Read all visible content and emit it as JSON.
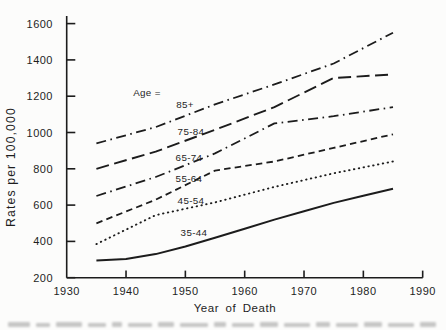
{
  "chart_data": {
    "type": "line",
    "title": "",
    "xlabel": "Year of Death",
    "ylabel": "Rates per 100,000",
    "legend_label": "Age =",
    "xlim": [
      1930,
      1990
    ],
    "ylim": [
      200,
      1600
    ],
    "x_ticks": [
      1930,
      1940,
      1950,
      1960,
      1970,
      1980,
      1990
    ],
    "y_ticks": [
      200,
      400,
      600,
      800,
      1000,
      1200,
      1400,
      1600
    ],
    "grid": false,
    "legend_position": "labels-on-lines",
    "ink_color": "#1c1c1c",
    "background_color": "#fcfcfb",
    "series": [
      {
        "name": "85+",
        "style": "dashdot",
        "points": [
          [
            1935,
            940
          ],
          [
            1945,
            1030
          ],
          [
            1955,
            1155
          ],
          [
            1965,
            1265
          ],
          [
            1975,
            1380
          ],
          [
            1985,
            1550
          ]
        ]
      },
      {
        "name": "75-84",
        "style": "longdash",
        "points": [
          [
            1935,
            800
          ],
          [
            1945,
            895
          ],
          [
            1955,
            1015
          ],
          [
            1965,
            1140
          ],
          [
            1975,
            1300
          ],
          [
            1985,
            1320
          ]
        ]
      },
      {
        "name": "65-74",
        "style": "dashdot",
        "points": [
          [
            1935,
            650
          ],
          [
            1945,
            755
          ],
          [
            1955,
            885
          ],
          [
            1965,
            1050
          ],
          [
            1975,
            1090
          ],
          [
            1985,
            1140
          ]
        ]
      },
      {
        "name": "55-64",
        "style": "mediumdash",
        "points": [
          [
            1935,
            500
          ],
          [
            1945,
            630
          ],
          [
            1955,
            790
          ],
          [
            1965,
            840
          ],
          [
            1975,
            915
          ],
          [
            1985,
            990
          ]
        ]
      },
      {
        "name": "45-54",
        "style": "dotted",
        "points": [
          [
            1935,
            385
          ],
          [
            1945,
            545
          ],
          [
            1955,
            615
          ],
          [
            1965,
            700
          ],
          [
            1975,
            775
          ],
          [
            1985,
            840
          ]
        ]
      },
      {
        "name": "35-44",
        "style": "solid",
        "points": [
          [
            1935,
            295
          ],
          [
            1940,
            303
          ],
          [
            1945,
            330
          ],
          [
            1950,
            372
          ],
          [
            1955,
            420
          ],
          [
            1960,
            470
          ],
          [
            1965,
            520
          ],
          [
            1970,
            566
          ],
          [
            1975,
            612
          ],
          [
            1980,
            652
          ],
          [
            1985,
            690
          ]
        ]
      }
    ]
  }
}
